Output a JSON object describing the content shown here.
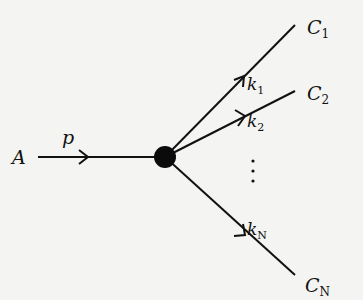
{
  "diagram": {
    "type": "branching-decay",
    "source": {
      "label": "A"
    },
    "incoming_edge": {
      "label": "p",
      "direction": "right"
    },
    "vertex": {
      "style": "filled-black-circle"
    },
    "branches": [
      {
        "target": "C",
        "target_sub": "1",
        "edge_label": "k",
        "edge_sub": "1"
      },
      {
        "target": "C",
        "target_sub": "2",
        "edge_label": "k",
        "edge_sub": "2"
      },
      {
        "target": "C",
        "target_sub": "N",
        "edge_label": "k",
        "edge_sub": "N"
      }
    ],
    "ellipsis": "⋮",
    "colors": {
      "ink": "#111111",
      "background": "#f4f4f2"
    }
  }
}
